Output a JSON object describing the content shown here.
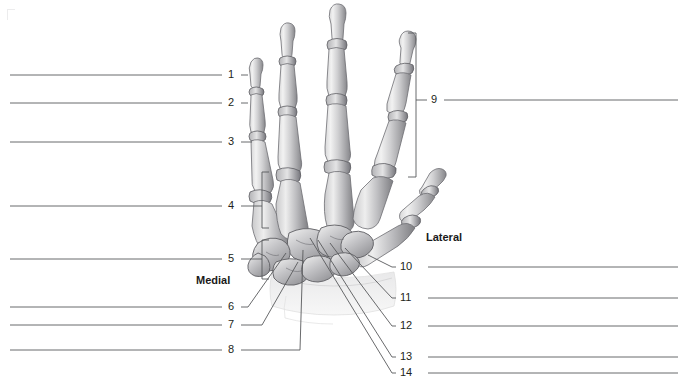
{
  "figure": {
    "background_color": "#ffffff",
    "line_color": "#58595b",
    "text_color": "#231f20"
  },
  "direction_labels": [
    {
      "id": "medial",
      "text": "Medial",
      "x": 196,
      "y": 274
    },
    {
      "id": "lateral",
      "text": "Lateral",
      "x": 426,
      "y": 231
    }
  ],
  "left_callouts": [
    {
      "number": "1",
      "label_x": 228,
      "label_y": 69,
      "line_y": 75,
      "line_x1": 10,
      "line_x2": 222,
      "tick_x2": 248,
      "type": "line"
    },
    {
      "number": "2",
      "label_x": 228,
      "label_y": 97,
      "line_y": 103,
      "line_x1": 10,
      "line_x2": 222,
      "tick_x2": 248,
      "type": "line"
    },
    {
      "number": "3",
      "label_x": 228,
      "label_y": 136,
      "line_y": 142,
      "line_x1": 10,
      "line_x2": 222,
      "tick_x2": 252,
      "type": "line"
    },
    {
      "number": "4",
      "label_x": 228,
      "label_y": 200,
      "line_y": 206,
      "line_x1": 10,
      "line_x2": 222,
      "tick_x2": 258,
      "type": "bracket",
      "bracket_x": 262,
      "bracket_top": 172,
      "bracket_bottom": 228,
      "bracket_arm": 7
    },
    {
      "number": "5",
      "label_x": 228,
      "label_y": 253,
      "line_y": 259,
      "line_x1": 10,
      "line_x2": 222,
      "tick_x2": 258,
      "type": "bracket",
      "bracket_x": 262,
      "bracket_top": 240,
      "bracket_bottom": 279,
      "bracket_arm": 7
    },
    {
      "number": "6",
      "label_x": 228,
      "label_y": 301,
      "line_y": 307,
      "line_x1": 10,
      "line_x2": 222,
      "tick_x2": 248,
      "type": "leader",
      "leader_x": 286,
      "leader_y": 253
    },
    {
      "number": "7",
      "label_x": 228,
      "label_y": 319,
      "line_y": 325,
      "line_x1": 10,
      "line_x2": 222,
      "tick_x2": 262,
      "type": "leader",
      "leader_x": 298,
      "leader_y": 262
    },
    {
      "number": "8",
      "label_x": 228,
      "label_y": 344,
      "line_y": 350,
      "line_x1": 10,
      "line_x2": 222,
      "tick_x2": 300,
      "type": "leader",
      "leader_x": 303,
      "leader_y": 250
    }
  ],
  "right_callouts": [
    {
      "number": "9",
      "label_x": 431,
      "label_y": 94,
      "line_y": 100,
      "line_x1": 444,
      "line_x2": 678,
      "tick_x1": 420,
      "type": "bracket",
      "bracket_x": 416,
      "bracket_top": 33,
      "bracket_bottom": 177,
      "bracket_arm": 8
    },
    {
      "number": "10",
      "label_x": 400,
      "label_y": 261,
      "line_y": 267,
      "line_x1": 428,
      "line_x2": 678,
      "tick_x1": 392,
      "type": "leader",
      "leader_x": 368,
      "leader_y": 255
    },
    {
      "number": "11",
      "label_x": 400,
      "label_y": 292,
      "line_y": 298,
      "line_x1": 428,
      "line_x2": 678,
      "tick_x1": 392,
      "type": "leader",
      "leader_x": 345,
      "leader_y": 248
    },
    {
      "number": "12",
      "label_x": 400,
      "label_y": 320,
      "line_y": 326,
      "line_x1": 428,
      "line_x2": 678,
      "tick_x1": 392,
      "type": "leader",
      "leader_x": 330,
      "leader_y": 243
    },
    {
      "number": "13",
      "label_x": 400,
      "label_y": 351,
      "line_y": 357,
      "line_x1": 428,
      "line_x2": 678,
      "tick_x1": 392,
      "type": "leader",
      "leader_x": 318,
      "leader_y": 240
    },
    {
      "number": "14",
      "label_x": 400,
      "label_y": 367,
      "line_y": 373,
      "line_x1": 428,
      "line_x2": 678,
      "tick_x1": 392,
      "type": "leader",
      "leader_x": 310,
      "leader_y": 238
    }
  ],
  "illustration": {
    "name": "hand-skeleton",
    "fingers": [
      {
        "id": "index-finger",
        "label": "index"
      },
      {
        "id": "middle-finger",
        "label": "middle"
      },
      {
        "id": "ring-finger",
        "label": "ring"
      },
      {
        "id": "little-finger",
        "label": "little"
      },
      {
        "id": "thumb",
        "label": "thumb"
      }
    ],
    "regions": [
      {
        "id": "phalanges",
        "label": "phalanges"
      },
      {
        "id": "metacarpals",
        "label": "metacarpals"
      },
      {
        "id": "carpals",
        "label": "carpals"
      },
      {
        "id": "radius-ulna",
        "label": "radius and ulna"
      }
    ]
  }
}
